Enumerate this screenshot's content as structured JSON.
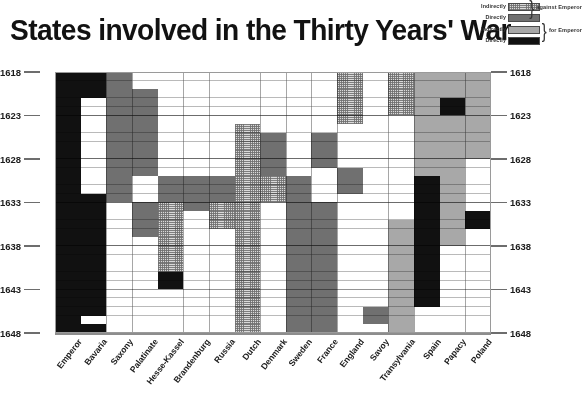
{
  "title": "States involved in the Thirty Years' War",
  "legend": {
    "rows": [
      {
        "label": "Indirectly",
        "fill": "indirect-against"
      },
      {
        "label": "Directly",
        "fill": "direct-against"
      },
      {
        "label": "Indirectly",
        "fill": "indirect-for"
      },
      {
        "label": "Directly",
        "fill": "direct-for"
      }
    ],
    "group_against": "against Emperor",
    "group_for": "for Emperor",
    "brace": "}"
  },
  "colors": {
    "indirect_against": "#d9d9d9",
    "direct_against": "#707070",
    "indirect_for": "#a8a8a8",
    "direct_for": "#111111",
    "none": "#ffffff",
    "grid": "#5a5a5a",
    "axis": "#8d8d8d",
    "text": "#1c1c1c"
  },
  "chart_data": {
    "type": "heatmap",
    "title": "States involved in the Thirty Years' War",
    "xlabel": "",
    "ylabel": "",
    "grid": true,
    "legend_position": "top-right",
    "ylim": [
      1618,
      1648
    ],
    "y_ticks": [
      1618,
      1623,
      1628,
      1633,
      1638,
      1643,
      1648
    ],
    "y_axis_both_sides": true,
    "years": [
      1618,
      1619,
      1620,
      1621,
      1622,
      1623,
      1624,
      1625,
      1626,
      1627,
      1628,
      1629,
      1630,
      1631,
      1632,
      1633,
      1634,
      1635,
      1636,
      1637,
      1638,
      1639,
      1640,
      1641,
      1642,
      1643,
      1644,
      1645,
      1646,
      1647
    ],
    "categories": [
      "Emperor",
      "Bavaria",
      "Saxony",
      "Palatinate",
      "Hesse-Kassel",
      "Brandenburg",
      "Russia",
      "Dutch",
      "Denmark",
      "Sweden",
      "France",
      "England",
      "Savoy",
      "Transylvania",
      "Spain",
      "Papacy",
      "Poland"
    ],
    "value_legend": {
      "0": "not involved",
      "1": "Indirectly against Emperor",
      "2": "Directly against Emperor",
      "3": "Indirectly for Emperor",
      "4": "Directly for Emperor"
    },
    "matrix": [
      [
        4,
        4,
        2,
        0,
        0,
        0,
        0,
        0,
        0,
        0,
        0,
        1,
        0,
        1,
        3,
        3,
        3
      ],
      [
        4,
        4,
        2,
        0,
        0,
        0,
        0,
        0,
        0,
        0,
        0,
        1,
        0,
        1,
        3,
        3,
        3
      ],
      [
        4,
        4,
        2,
        2,
        0,
        0,
        0,
        0,
        0,
        0,
        0,
        1,
        0,
        1,
        3,
        3,
        3
      ],
      [
        4,
        0,
        2,
        2,
        0,
        0,
        0,
        0,
        0,
        0,
        0,
        1,
        0,
        1,
        3,
        4,
        3
      ],
      [
        4,
        0,
        2,
        2,
        0,
        0,
        0,
        0,
        0,
        0,
        0,
        1,
        0,
        1,
        3,
        4,
        3
      ],
      [
        4,
        0,
        2,
        2,
        0,
        0,
        0,
        0,
        0,
        0,
        0,
        1,
        0,
        0,
        3,
        3,
        3
      ],
      [
        4,
        0,
        2,
        2,
        0,
        0,
        0,
        1,
        0,
        0,
        0,
        0,
        0,
        0,
        3,
        3,
        3
      ],
      [
        4,
        0,
        2,
        2,
        0,
        0,
        0,
        1,
        2,
        0,
        2,
        0,
        0,
        0,
        3,
        3,
        3
      ],
      [
        4,
        0,
        2,
        2,
        0,
        0,
        0,
        1,
        2,
        0,
        2,
        0,
        0,
        0,
        3,
        3,
        3
      ],
      [
        4,
        0,
        2,
        2,
        0,
        0,
        0,
        1,
        2,
        0,
        2,
        0,
        0,
        0,
        3,
        3,
        3
      ],
      [
        4,
        0,
        2,
        2,
        0,
        0,
        0,
        1,
        2,
        0,
        2,
        0,
        0,
        0,
        3,
        3,
        0
      ],
      [
        4,
        0,
        2,
        2,
        0,
        0,
        0,
        1,
        2,
        0,
        0,
        2,
        0,
        0,
        3,
        3,
        0
      ],
      [
        4,
        0,
        2,
        0,
        2,
        2,
        2,
        1,
        1,
        2,
        0,
        2,
        0,
        0,
        4,
        3,
        0
      ],
      [
        4,
        0,
        2,
        0,
        2,
        2,
        2,
        1,
        1,
        2,
        0,
        2,
        0,
        0,
        4,
        3,
        0
      ],
      [
        4,
        4,
        2,
        0,
        2,
        2,
        2,
        1,
        1,
        2,
        0,
        0,
        0,
        0,
        4,
        3,
        0
      ],
      [
        4,
        4,
        0,
        2,
        1,
        2,
        1,
        1,
        0,
        2,
        2,
        0,
        0,
        0,
        4,
        3,
        0
      ],
      [
        4,
        4,
        0,
        2,
        1,
        0,
        1,
        1,
        0,
        2,
        2,
        0,
        0,
        0,
        4,
        3,
        4
      ],
      [
        4,
        4,
        0,
        2,
        1,
        0,
        1,
        1,
        0,
        2,
        2,
        0,
        0,
        3,
        4,
        3,
        4
      ],
      [
        4,
        4,
        0,
        2,
        1,
        0,
        0,
        1,
        0,
        2,
        2,
        0,
        0,
        3,
        4,
        3,
        0
      ],
      [
        4,
        4,
        0,
        0,
        1,
        0,
        0,
        1,
        0,
        2,
        2,
        0,
        0,
        3,
        4,
        3,
        0
      ],
      [
        4,
        4,
        0,
        0,
        1,
        0,
        0,
        1,
        0,
        2,
        2,
        0,
        0,
        3,
        4,
        0,
        0
      ],
      [
        4,
        4,
        0,
        0,
        1,
        0,
        0,
        1,
        0,
        2,
        2,
        0,
        0,
        3,
        4,
        0,
        0
      ],
      [
        4,
        4,
        0,
        0,
        1,
        0,
        0,
        1,
        0,
        2,
        2,
        0,
        0,
        3,
        4,
        0,
        0
      ],
      [
        4,
        4,
        0,
        0,
        4,
        0,
        0,
        1,
        0,
        2,
        2,
        0,
        0,
        3,
        4,
        0,
        0
      ],
      [
        4,
        4,
        0,
        0,
        4,
        0,
        0,
        1,
        0,
        2,
        2,
        0,
        0,
        3,
        4,
        0,
        0
      ],
      [
        4,
        4,
        0,
        0,
        0,
        0,
        0,
        1,
        0,
        2,
        2,
        0,
        0,
        3,
        4,
        0,
        0
      ],
      [
        4,
        4,
        0,
        0,
        0,
        0,
        0,
        1,
        0,
        2,
        2,
        0,
        0,
        3,
        4,
        0,
        0
      ],
      [
        4,
        4,
        0,
        0,
        0,
        0,
        0,
        1,
        0,
        2,
        2,
        0,
        2,
        3,
        0,
        0,
        0
      ],
      [
        4,
        0,
        0,
        0,
        0,
        0,
        0,
        1,
        0,
        2,
        2,
        0,
        2,
        3,
        0,
        0,
        0
      ],
      [
        4,
        4,
        0,
        0,
        0,
        0,
        0,
        1,
        0,
        2,
        2,
        0,
        0,
        3,
        0,
        0,
        0
      ]
    ]
  }
}
